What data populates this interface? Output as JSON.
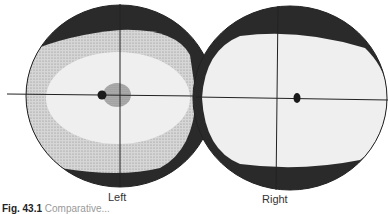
{
  "figure": {
    "labels": {
      "left": "Left",
      "right": "Right"
    },
    "caption": {
      "number": "Fig. 43.1",
      "text": "Comparative..."
    },
    "colors": {
      "outer_band": "#2a2a2a",
      "stippled_zone": "#c8c8c8",
      "inner_field": "#ececec",
      "central_spot": "#a9a9a9",
      "blind_spot": "#1a1a1a",
      "axes": "#222222"
    },
    "eyes": [
      {
        "name": "left",
        "has_central_scotoma": true
      },
      {
        "name": "right",
        "has_central_scotoma": false
      }
    ]
  }
}
